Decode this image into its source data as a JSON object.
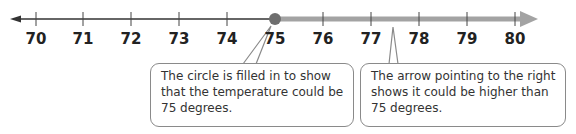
{
  "number_line": {
    "ticks": [
      "70",
      "71",
      "72",
      "73",
      "74",
      "75",
      "76",
      "77",
      "78",
      "79",
      "80"
    ],
    "min": 70,
    "max": 80,
    "closed_point": 75,
    "direction": "right",
    "colors": {
      "line": "#333333",
      "highlight": "#9a9a9a",
      "point": "#707070"
    }
  },
  "callouts": [
    {
      "text": "The circle is filled in to show that the temperature could be 75 degrees.",
      "points_to": "closed-circle-at-75"
    },
    {
      "text": "The arrow pointing to the right shows it could be higher than 75 degrees.",
      "points_to": "shaded-arrow-right"
    }
  ]
}
